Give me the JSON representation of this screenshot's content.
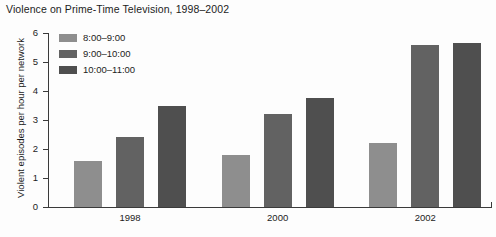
{
  "chart_data": {
    "type": "bar",
    "title": "Violence on Prime-Time Television, 1998–2002",
    "xlabel": "",
    "ylabel": "Violent episodes per hour per network",
    "categories": [
      "1998",
      "2000",
      "2002"
    ],
    "ylim": [
      0,
      6
    ],
    "yticks": [
      0,
      1,
      2,
      3,
      4,
      5,
      6
    ],
    "ytick_labels": [
      "0",
      "1",
      "2",
      "3",
      "4",
      "5",
      "6"
    ],
    "grid": false,
    "legend_position": "upper-left-inside",
    "series": [
      {
        "name": "8:00–9:00",
        "color": "#8e8e8e",
        "values": [
          1.6,
          1.8,
          2.2
        ]
      },
      {
        "name": "9:00–10:00",
        "color": "#626262",
        "values": [
          2.4,
          3.2,
          5.6
        ]
      },
      {
        "name": "10:00–11:00",
        "color": "#4f4f4f",
        "values": [
          3.5,
          3.75,
          5.65
        ]
      }
    ]
  },
  "colors": {
    "axis": "#3a3a3a",
    "text": "#1c1c1c",
    "background": "#fdfdfd",
    "series_1": "#8e8e8e",
    "series_2": "#626262",
    "series_3": "#4f4f4f"
  }
}
